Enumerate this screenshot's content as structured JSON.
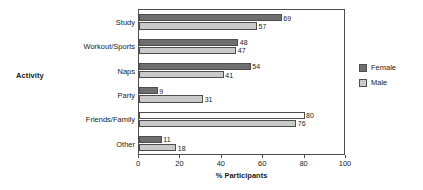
{
  "chart_data": {
    "type": "bar",
    "orientation": "horizontal",
    "title": "",
    "xlabel": "% Participants",
    "ylabel": "Activity",
    "xlim": [
      0,
      100
    ],
    "xticks": [
      0,
      20,
      40,
      60,
      80,
      100
    ],
    "grid": false,
    "legend_position": "right",
    "categories": [
      "Study",
      "Workout/Sports",
      "Naps",
      "Party",
      "Friends/Family",
      "Other"
    ],
    "series": [
      {
        "name": "Female",
        "color": "#6e6e6e",
        "values": [
          69,
          48,
          54,
          9,
          80,
          11
        ]
      },
      {
        "name": "Male",
        "color": "#c9c9c9",
        "values": [
          57,
          47,
          41,
          31,
          76,
          18
        ]
      }
    ]
  },
  "legend": {
    "entries": [
      {
        "label": "Female",
        "swatch": "female"
      },
      {
        "label": "Male",
        "swatch": "male"
      }
    ]
  }
}
